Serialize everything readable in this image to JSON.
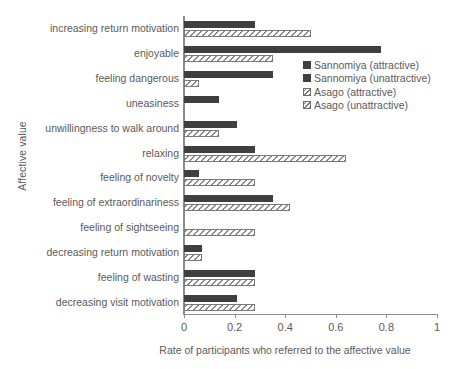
{
  "chart_data": {
    "type": "bar",
    "orientation": "horizontal",
    "title": "",
    "xlabel": "Rate of participants who referred to the affective value",
    "ylabel": "Affective value",
    "xlim": [
      0,
      1
    ],
    "xticks": [
      "0",
      "0.2",
      "0.4",
      "0.6",
      "0.8",
      "1"
    ],
    "xtick_values": [
      0,
      0.2,
      0.4,
      0.6,
      0.8,
      1
    ],
    "grid": false,
    "legend_position": "upper right",
    "categories": [
      "increasing return motivation",
      "enjoyable",
      "feeling dangerous",
      "uneasiness",
      "unwillingness to walk around",
      "relaxing",
      "feeling of novelty",
      "feeling of extraordinariness",
      "feeling of sightseeing",
      "decreasing return motivation",
      "feeling of wasting",
      "decreasing visit motivation"
    ],
    "series": [
      {
        "name": "Sannomiya (attractive)",
        "style": "solid",
        "color": "#3f3f3f",
        "values": [
          0.28,
          0.78,
          0.35,
          0.14,
          0.21,
          0.28,
          0.06,
          0.35,
          0.0,
          0.07,
          0.28,
          0.21
        ]
      },
      {
        "name": "Asago (attractive)",
        "style": "hatch",
        "color": "#8a8a8a",
        "values": [
          0.5,
          0.35,
          0.06,
          0.0,
          0.14,
          0.64,
          0.28,
          0.42,
          0.28,
          0.07,
          0.28,
          0.28
        ]
      }
    ],
    "legend_entries": [
      {
        "label": "Sannomiya (attractive)",
        "style": "solid"
      },
      {
        "label": "Sannomiya (unattractive)",
        "style": "solid"
      },
      {
        "label": "Asago (attractive)",
        "style": "hatch"
      },
      {
        "label": "Asago (unattractive)",
        "style": "hatch"
      }
    ]
  }
}
